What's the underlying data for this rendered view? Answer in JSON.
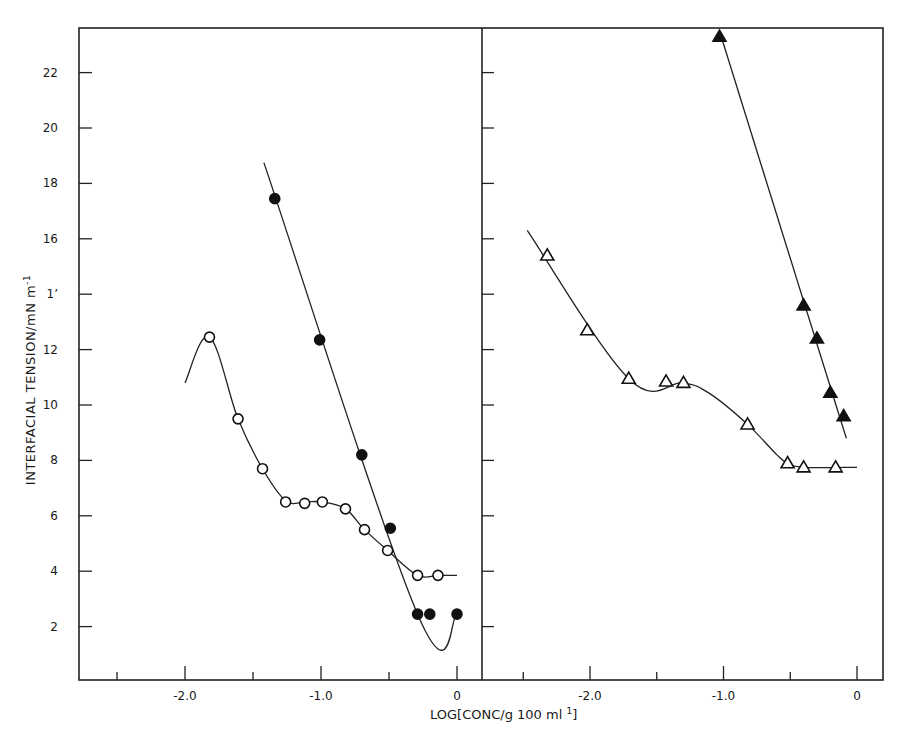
{
  "chart_data": {
    "type": "line",
    "title": "",
    "ylabel": "INTERFACIAL TENSION/mN m",
    "ylabel_sup": "-1",
    "xlabel": "LOG[CONC/g 100 ml",
    "xlabel_sup": "1",
    "xlabel_end": "]",
    "ylim": [
      0,
      24
    ],
    "y_ticks": [
      2,
      4,
      6,
      8,
      10,
      12,
      14,
      16,
      18,
      20,
      22
    ],
    "y_tick_labels": [
      "2",
      "4",
      "6",
      "8",
      "10",
      "12",
      "1’",
      "16",
      "18",
      "20",
      "22"
    ],
    "grid": false,
    "panels": [
      {
        "name": "left",
        "xlim": [
          -2.6,
          0.18
        ],
        "x_ticks": [
          -2.5,
          -2.0,
          -1.5,
          -1.0,
          -0.5,
          0
        ],
        "x_tick_labels": [
          "",
          "-2.0",
          "",
          "-1.0",
          "",
          "0"
        ],
        "series": [
          {
            "name": "open circles",
            "marker": "circle-open",
            "points": [
              [
                -1.82,
                12.45
              ],
              [
                -1.61,
                9.5
              ],
              [
                -1.43,
                7.7
              ],
              [
                -1.26,
                6.5
              ],
              [
                -1.12,
                6.45
              ],
              [
                -0.99,
                6.5
              ],
              [
                -0.82,
                6.25
              ],
              [
                -0.68,
                5.5
              ],
              [
                -0.51,
                4.75
              ],
              [
                -0.29,
                3.85
              ],
              [
                -0.14,
                3.85
              ]
            ],
            "line": [
              [
                -2.0,
                10.8
              ],
              [
                -1.82,
                12.45
              ]
            ],
            "curve": [
              [
                -2.0,
                10.8
              ],
              [
                -1.82,
                12.45
              ],
              [
                -1.61,
                9.5
              ],
              [
                -1.43,
                7.7
              ],
              [
                -1.26,
                6.55
              ],
              [
                -1.12,
                6.5
              ],
              [
                -0.99,
                6.5
              ],
              [
                -0.82,
                6.25
              ],
              [
                -0.68,
                5.5
              ],
              [
                -0.51,
                4.75
              ],
              [
                -0.29,
                3.85
              ],
              [
                -0.14,
                3.85
              ],
              [
                0.0,
                3.85
              ]
            ]
          },
          {
            "name": "filled circles",
            "marker": "circle-filled",
            "points": [
              [
                -1.34,
                17.45
              ],
              [
                -1.01,
                12.35
              ],
              [
                -0.7,
                8.2
              ],
              [
                -0.49,
                5.55
              ],
              [
                -0.29,
                2.45
              ],
              [
                -0.2,
                2.45
              ],
              [
                0.0,
                2.45
              ]
            ],
            "curve": [
              [
                -1.42,
                18.75
              ],
              [
                -0.29,
                2.45
              ],
              [
                0.0,
                2.45
              ]
            ]
          }
        ]
      },
      {
        "name": "right",
        "xlim": [
          -2.76,
          0.2
        ],
        "x_ticks": [
          -2.5,
          -2.0,
          -1.5,
          -1.0,
          -0.5,
          0
        ],
        "x_tick_labels": [
          "",
          "-2.0",
          "",
          "-1.0",
          "",
          "0"
        ],
        "series": [
          {
            "name": "open triangles",
            "marker": "triangle-open",
            "points": [
              [
                -2.32,
                15.4
              ],
              [
                -2.02,
                12.7
              ],
              [
                -1.71,
                10.95
              ],
              [
                -1.43,
                10.85
              ],
              [
                -1.3,
                10.8
              ],
              [
                -0.82,
                9.3
              ],
              [
                -0.52,
                7.9
              ],
              [
                -0.4,
                7.75
              ],
              [
                -0.16,
                7.75
              ]
            ],
            "curve": [
              [
                -2.47,
                16.3
              ],
              [
                -1.71,
                10.95
              ],
              [
                -1.3,
                10.8
              ],
              [
                -1.1,
                10.4
              ],
              [
                -0.82,
                9.3
              ],
              [
                -0.6,
                8.2
              ],
              [
                -0.52,
                7.9
              ],
              [
                -0.4,
                7.75
              ],
              [
                0.0,
                7.75
              ]
            ]
          },
          {
            "name": "filled triangles",
            "marker": "triangle-filled",
            "points": [
              [
                -1.03,
                23.3
              ],
              [
                -0.4,
                13.6
              ],
              [
                -0.3,
                12.4
              ],
              [
                -0.2,
                10.45
              ],
              [
                -0.1,
                9.6
              ]
            ],
            "curve": [
              [
                -1.03,
                23.5
              ],
              [
                -0.08,
                8.8
              ]
            ]
          }
        ]
      }
    ]
  }
}
